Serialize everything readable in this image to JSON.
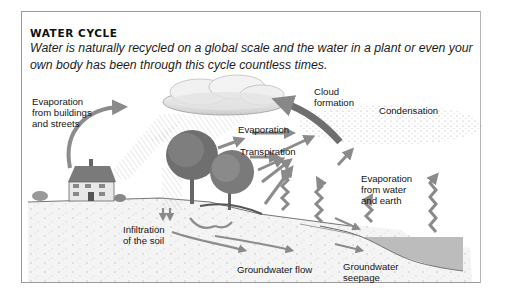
{
  "header": {
    "title": "WATER CYCLE",
    "subtitle": "Water is naturally recycled on a global scale and the water in a plant or even your own body has been through this cycle countless times."
  },
  "labels": {
    "evaporation_buildings": "Evaporation\nfrom buildings\nand streets",
    "cloud_formation": "Cloud\nformation",
    "condensation": "Condensation",
    "evaporation": "Evaporation",
    "transpiration": "Transpiration",
    "evaporation_water_earth": "Evaporation\nfrom water\nand earth",
    "infiltration": "Infiltration\nof the soil",
    "groundwater_flow": "Groundwater flow",
    "groundwater_seepage": "Groundwater\nseepage"
  },
  "colors": {
    "frame": "#9a9a9a",
    "arrow": "#8c8c8c",
    "arrow_dark": "#6e6e6e",
    "water": "#b9b9b9",
    "soil": "#eeeeee",
    "text": "#151515"
  }
}
